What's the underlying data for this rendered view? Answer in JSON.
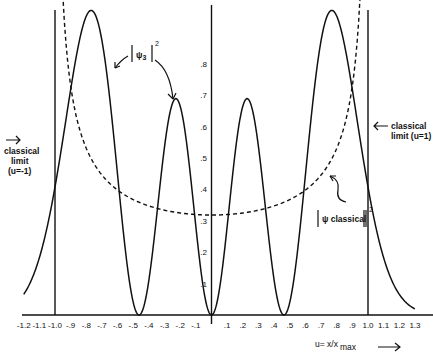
{
  "chart_data": {
    "type": "line",
    "title": "",
    "xlabel": "u= x/x max",
    "ylabel": "",
    "xlim": [
      -1.25,
      1.35
    ],
    "ylim": [
      0,
      1.0
    ],
    "grid": false,
    "x_ticks": [
      "-1.2",
      "-1.1",
      "-1.0",
      "-.9",
      "-.8",
      "-.7",
      "-.6",
      "-.5",
      "-.4",
      "-.3",
      "-.2",
      "-.1",
      ".1",
      ".2",
      ".3",
      ".4",
      ".5",
      ".6",
      ".7",
      ".8",
      ".9",
      "1.0",
      "1.1",
      "1.2",
      "1.3"
    ],
    "y_ticks": [
      ".1",
      ".2",
      ".3",
      ".4",
      ".5",
      ".6",
      ".7",
      ".8"
    ],
    "series": [
      {
        "name": "|ψ3|²",
        "style": "solid",
        "description": "Quantum probability density for n=3 harmonic oscillator state",
        "x": [
          -1.2,
          -1.1,
          -1.0,
          -0.9,
          -0.8,
          -0.7,
          -0.6,
          -0.5,
          -0.45,
          -0.4,
          -0.3,
          -0.2,
          -0.1,
          0.0,
          0.1,
          0.2,
          0.3,
          0.4,
          0.45,
          0.5,
          0.6,
          0.7,
          0.8,
          0.9,
          1.0,
          1.1,
          1.2,
          1.3
        ],
        "values": [
          0.12,
          0.25,
          0.46,
          0.78,
          0.97,
          0.9,
          0.55,
          0.13,
          0.0,
          0.07,
          0.52,
          0.69,
          0.4,
          0.0,
          0.4,
          0.69,
          0.52,
          0.07,
          0.0,
          0.13,
          0.55,
          0.9,
          0.97,
          0.78,
          0.46,
          0.25,
          0.12,
          0.05
        ]
      },
      {
        "name": "|ψ classical|²",
        "style": "dashed",
        "description": "Classical probability density 1/(π√(1−u²)), defined for |u|<1",
        "x": [
          -0.95,
          -0.9,
          -0.8,
          -0.6,
          -0.4,
          -0.2,
          0.0,
          0.2,
          0.4,
          0.6,
          0.8,
          0.9,
          0.95
        ],
        "values": [
          1.02,
          0.73,
          0.53,
          0.4,
          0.35,
          0.325,
          0.318,
          0.325,
          0.35,
          0.4,
          0.53,
          0.73,
          1.02
        ]
      }
    ],
    "vertical_lines": [
      {
        "x": -1.0,
        "label": "classical limit (u=-1)"
      },
      {
        "x": 0.0,
        "label": ""
      },
      {
        "x": 1.0,
        "label": "classical limit (u=1)"
      }
    ],
    "annotations": [
      {
        "text": "|ψ3|²",
        "target": "inner and outer left peaks"
      },
      {
        "text": "|ψ classical|²",
        "target": "dashed curve"
      },
      {
        "text": "classical limit (u=-1)",
        "position": "left"
      },
      {
        "text": "classical limit (u=1)",
        "position": "right"
      }
    ]
  },
  "labels": {
    "left_limit_line1": "classical",
    "left_limit_line2": "limit",
    "left_limit_line3": "(u=-1)",
    "right_limit_line1": "classical",
    "right_limit_line2": "limit (u=1)",
    "psi3_symbol": "ψ",
    "psi3_sub": "3",
    "psi3_sup": "2",
    "psicl_text": "ψ classical",
    "psicl_sup": "2",
    "xlabel_main": "u= x/x",
    "xlabel_sub": "max",
    "xlabel_arrow": "⟶"
  }
}
